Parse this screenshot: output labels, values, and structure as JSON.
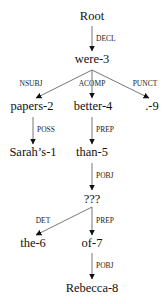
{
  "diagram": {
    "type": "dependency-parse-tree",
    "colors": {
      "edge": "#777777",
      "arrowhead": "#111111",
      "text": "#111111"
    },
    "nodes": [
      {
        "id": "root",
        "label": "Root",
        "x": 92,
        "y": 16
      },
      {
        "id": "were3",
        "label": "were-3",
        "x": 92,
        "y": 59
      },
      {
        "id": "papers2",
        "label": "papers-2",
        "x": 32,
        "y": 106
      },
      {
        "id": "better4",
        "label": "better-4",
        "x": 93,
        "y": 106
      },
      {
        "id": "punct9",
        "label": ".-9",
        "x": 152,
        "y": 106
      },
      {
        "id": "sarahs1",
        "label": "Sarah’s-1",
        "x": 33,
        "y": 152
      },
      {
        "id": "than5",
        "label": "than-5",
        "x": 92,
        "y": 152
      },
      {
        "id": "unknown",
        "label": "???",
        "x": 92,
        "y": 199
      },
      {
        "id": "the6",
        "label": "the-6",
        "x": 33,
        "y": 243
      },
      {
        "id": "of7",
        "label": "of-7",
        "x": 92,
        "y": 243
      },
      {
        "id": "rebecca8",
        "label": "Rebecca-8",
        "x": 92,
        "y": 288
      }
    ],
    "edges": [
      {
        "from": "root",
        "to": "were3",
        "label": "DECL",
        "x1": 92,
        "y1": 26,
        "x2": 92,
        "y2": 51,
        "lx": 96,
        "ly": 39,
        "align": "left"
      },
      {
        "from": "were3",
        "to": "papers2",
        "label": "NSUBJ",
        "x1": 92,
        "y1": 70,
        "x2": 36,
        "y2": 98,
        "lx": 31,
        "ly": 84,
        "align": "center"
      },
      {
        "from": "were3",
        "to": "better4",
        "label": "ACOMP",
        "x1": 92,
        "y1": 70,
        "x2": 92,
        "y2": 98,
        "lx": 92,
        "ly": 84,
        "align": "center"
      },
      {
        "from": "were3",
        "to": "punct9",
        "label": "PUNCT",
        "x1": 92,
        "y1": 70,
        "x2": 149,
        "y2": 98,
        "lx": 145,
        "ly": 84,
        "align": "center"
      },
      {
        "from": "papers2",
        "to": "sarahs1",
        "label": "POSS",
        "x1": 33,
        "y1": 117,
        "x2": 33,
        "y2": 144,
        "lx": 37,
        "ly": 130,
        "align": "left"
      },
      {
        "from": "better4",
        "to": "than5",
        "label": "PREP",
        "x1": 92,
        "y1": 117,
        "x2": 92,
        "y2": 144,
        "lx": 96,
        "ly": 130,
        "align": "left"
      },
      {
        "from": "than5",
        "to": "unknown",
        "label": "POBJ",
        "x1": 92,
        "y1": 163,
        "x2": 92,
        "y2": 190,
        "lx": 96,
        "ly": 176,
        "align": "left"
      },
      {
        "from": "unknown",
        "to": "the6",
        "label": "DET",
        "x1": 92,
        "y1": 207,
        "x2": 36,
        "y2": 235,
        "lx": 43,
        "ly": 221,
        "align": "center"
      },
      {
        "from": "unknown",
        "to": "of7",
        "label": "PREP",
        "x1": 92,
        "y1": 207,
        "x2": 92,
        "y2": 235,
        "lx": 96,
        "ly": 221,
        "align": "left"
      },
      {
        "from": "of7",
        "to": "rebecca8",
        "label": "POBJ",
        "x1": 92,
        "y1": 253,
        "x2": 92,
        "y2": 279,
        "lx": 96,
        "ly": 266,
        "align": "left"
      }
    ]
  }
}
